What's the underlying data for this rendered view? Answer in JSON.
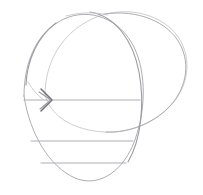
{
  "image": {
    "kind": "pencil-sketch",
    "subject": "two overlapping ellipses with horizontal arrow and chord lines",
    "width": 203,
    "height": 195,
    "background_color": "#ffffff",
    "caption": ""
  },
  "palette": {
    "paper": "#ffffff",
    "graphite_faint": "#c8c8cc",
    "graphite_light": "#b9b9bc",
    "graphite_mid": "#9a9aa0",
    "graphite_dark": "#6e6e76"
  },
  "shapes": {
    "front_circle": {
      "label": "front-circle",
      "cx": 83,
      "cy": 98,
      "rx": 60,
      "ry": 84,
      "rotation": -4,
      "color": "#aeaeb2"
    },
    "back_ellipse": {
      "label": "back-ellipse",
      "cx": 115,
      "cy": 73,
      "rx": 74,
      "ry": 60,
      "rotation": -6,
      "color": "#b9b9bc"
    }
  },
  "arrow": {
    "label": "horizontal-axis-arrow",
    "y": 100,
    "x_start": 24,
    "x_end": 140,
    "head_x": 52,
    "head_size": 11,
    "direction": "right",
    "line_color": "#b9b9bc",
    "head_color": "#6e6e76"
  },
  "chords": [
    {
      "label": "chord-upper",
      "y": 141,
      "x_start": 31,
      "x_end": 133,
      "color": "#aeaeb2"
    },
    {
      "label": "chord-lower",
      "y": 163,
      "x_start": 41,
      "x_end": 126,
      "color": "#aeaeb2"
    }
  ],
  "annotations": {
    "title": "",
    "notes": ""
  }
}
